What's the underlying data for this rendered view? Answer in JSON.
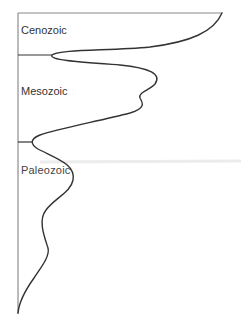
{
  "diagram": {
    "type": "diversity-curve",
    "colors": {
      "axis": "#777777",
      "curve": "#333333",
      "artifact": "#e4e4e4"
    },
    "eras": [
      {
        "name": "Cenozoic",
        "label": "Cenozoic"
      },
      {
        "name": "Mesozoic",
        "label": "Mesozoic"
      },
      {
        "name": "Paleozoic",
        "label": "Paleozoic"
      }
    ]
  }
}
